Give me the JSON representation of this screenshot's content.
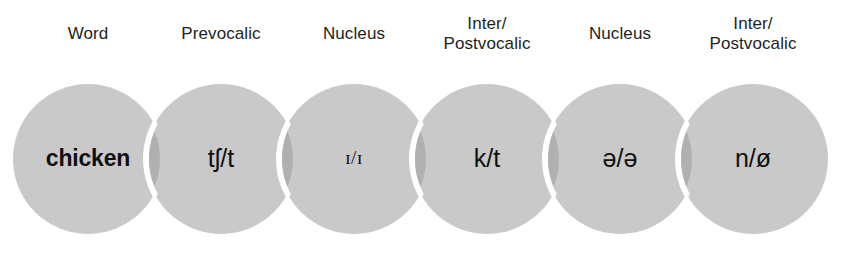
{
  "figure": {
    "kind": "overlapping-circles-diagram",
    "background_color": "#ffffff",
    "circle_fill": "#c9c9c9",
    "circle_overlap_fill": "#b0b0b0",
    "circle_separator_color": "#ffffff",
    "text_color": "#100f10",
    "header_color": "#231f20"
  },
  "columns": [
    {
      "header": "Word",
      "value": "chicken",
      "style": "bold",
      "cx": 88,
      "cy": 159,
      "r": 75
    },
    {
      "header": "Prevocalic",
      "value": "tʃ/t",
      "style": "normal",
      "cx": 221,
      "cy": 159,
      "r": 75
    },
    {
      "header": "Nucleus",
      "value": "ɪ/ɪ",
      "style": "smallcap",
      "cx": 354,
      "cy": 159,
      "r": 75
    },
    {
      "header": "Inter/\nPostvocalic",
      "value": "k/t",
      "style": "normal",
      "cx": 487,
      "cy": 159,
      "r": 75
    },
    {
      "header": "Nucleus",
      "value": "ə/ə",
      "style": "normal",
      "cx": 620,
      "cy": 159,
      "r": 75
    },
    {
      "header": "Inter/\nPostvocalic",
      "value": "n/ø",
      "style": "normal",
      "cx": 753,
      "cy": 159,
      "r": 75
    }
  ]
}
